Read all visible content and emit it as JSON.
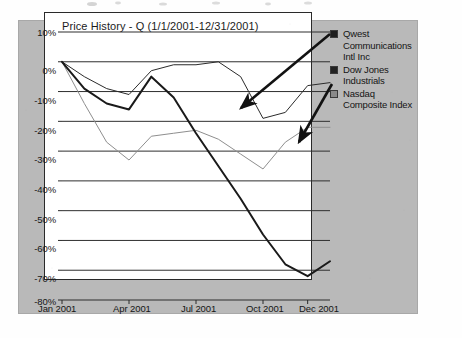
{
  "figure": {
    "panel_bg_color": "#b9b9b9",
    "plot_bg_color": "#ffffff",
    "frame_color": "#2a2a2a"
  },
  "legend": {
    "position": "right",
    "entries": [
      {
        "label": "Qwest Communications Intl Inc",
        "color": "#1a1a1a",
        "swatch": "#1d1d1d"
      },
      {
        "label": "Dow Jones Industrials",
        "color": "#2b2b2b",
        "swatch": "#232323"
      },
      {
        "label": "Nasdaq Composite Index",
        "color": "#8e8e8e",
        "swatch": "#8a8a8a"
      }
    ]
  },
  "annotations": {
    "arrow_dow_label": "arrow-to-dow-jones-line",
    "arrow_nasdaq_label": "arrow-to-nasdaq-line"
  },
  "chart_data": {
    "type": "line",
    "title": "Price History - Q (1/1/2001-12/31/2001)",
    "xlabel": "",
    "ylabel": "",
    "grid": true,
    "legend_position": "right",
    "ylim": [
      -80,
      10
    ],
    "yticks": [
      10,
      0,
      -10,
      -20,
      -30,
      -40,
      -50,
      -60,
      -70,
      -80
    ],
    "ytick_labels": [
      "10%",
      "0%",
      "-10%",
      "-20%",
      "-30%",
      "-40%",
      "-50%",
      "-60%",
      "-70%",
      "-80%"
    ],
    "xtick_labels": [
      "Jan 2001",
      "Apr 2001",
      "Jul 2001",
      "Oct 2001",
      "Dec 2001"
    ],
    "xtick_positions": [
      0,
      3,
      6,
      9,
      11
    ],
    "x": [
      0,
      1,
      2,
      3,
      4,
      5,
      6,
      7,
      8,
      9,
      10,
      11,
      12
    ],
    "x_labels": [
      "Jan 2001",
      "Feb 2001",
      "Mar 2001",
      "Apr 2001",
      "May 2001",
      "Jun 2001",
      "Jul 2001",
      "Aug 2001",
      "Sep 2001",
      "Oct 2001",
      "Nov 2001",
      "Dec 2001",
      "Dec 31 2001"
    ],
    "series": [
      {
        "name": "Qwest Communications Intl Inc",
        "color": "#1a1a1a",
        "width": 2.0,
        "values": [
          0,
          -9,
          -14,
          -16,
          -5,
          -12,
          -24,
          -35,
          -46,
          -58,
          -68,
          -72,
          -67
        ]
      },
      {
        "name": "Dow Jones Industrials",
        "color": "#2b2b2b",
        "width": 1.0,
        "values": [
          0,
          -5,
          -9,
          -11,
          -3,
          -1,
          -1,
          0,
          -5,
          -19,
          -17,
          -8,
          -7
        ]
      },
      {
        "name": "Nasdaq Composite Index",
        "color": "#8e8e8e",
        "width": 1.0,
        "values": [
          0,
          -14,
          -27,
          -33,
          -25,
          -24,
          -23,
          -26,
          -31,
          -36,
          -27,
          -22,
          -22
        ]
      }
    ]
  }
}
